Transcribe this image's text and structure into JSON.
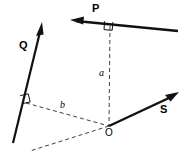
{
  "figure": {
    "type": "vector-moment-diagram",
    "width": 191,
    "height": 164,
    "background_color": "#ffffff",
    "line_color": "#111111",
    "dash_color": "#2b2b2b",
    "labels": {
      "vector_p": "P",
      "vector_q": "Q",
      "vector_s": "S",
      "distance_a": "a",
      "distance_b": "b",
      "origin": "O"
    },
    "elements": {
      "p_line": {
        "name": "force-line-p",
        "from_x": 72,
        "from_y": 21,
        "to_x": 178,
        "to_y": 31,
        "arrow_at": "start",
        "arrow_direction": "left",
        "stroke_width": 2.4
      },
      "q_line": {
        "name": "force-line-q",
        "from_x": 13,
        "from_y": 143,
        "to_x": 42,
        "to_y": 24,
        "arrow_at": "end",
        "arrow_direction": "up-right",
        "stroke_width": 2.2
      },
      "s_line": {
        "name": "force-line-s",
        "from_x": 109,
        "from_y": 126,
        "to_x": 177,
        "to_y": 94,
        "arrow_at": "end",
        "arrow_direction": "up-right",
        "stroke_width": 2.4
      },
      "s_line_extension": {
        "name": "dashed-extension-s",
        "from_x": 109,
        "from_y": 126,
        "to_x": 30,
        "to_y": 151
      },
      "a_dashed": {
        "name": "moment-arm-a",
        "from_x": 110,
        "from_y": 26,
        "to_x": 109,
        "to_y": 126
      },
      "b_dashed": {
        "name": "moment-arm-b",
        "from_x": 26,
        "from_y": 103,
        "to_x": 109,
        "to_y": 126
      },
      "right_angle_p": {
        "name": "right-angle-marker-p",
        "x": 106,
        "y": 21
      },
      "right_angle_q": {
        "name": "right-angle-marker-q",
        "x": 22,
        "y": 97
      },
      "origin_point": {
        "name": "origin-point",
        "x": 109,
        "y": 126
      }
    },
    "label_positions": {
      "vector_p": {
        "x": 92,
        "y": 3
      },
      "vector_q": {
        "x": 19,
        "y": 40
      },
      "vector_s": {
        "x": 160,
        "y": 104
      },
      "distance_a": {
        "x": 99,
        "y": 68
      },
      "distance_b": {
        "x": 60,
        "y": 100
      },
      "origin": {
        "x": 105,
        "y": 128
      }
    }
  }
}
